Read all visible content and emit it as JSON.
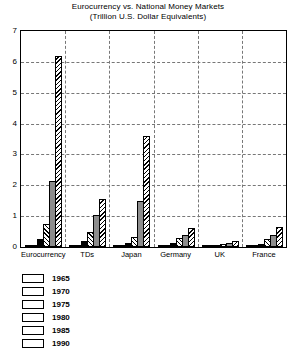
{
  "chart_data": {
    "type": "bar",
    "title": "Eurocurrency vs. National Money Markets",
    "subtitle": "(Trillion U.S.  Dollar Equivalents)",
    "xlabel": "",
    "ylabel": "",
    "ylim": [
      0,
      7
    ],
    "yticks": [
      0,
      1,
      2,
      3,
      4,
      5,
      6,
      7
    ],
    "grid": true,
    "legend_position": "below-left",
    "categories": [
      "Eurocurrency",
      "TDs",
      "Japan",
      "Germany",
      "UK",
      "France"
    ],
    "series": [
      {
        "name": "1965",
        "pattern": "solid-black",
        "color": "#000000",
        "values": [
          0.02,
          0.03,
          0.02,
          0.02,
          0.01,
          0.02
        ]
      },
      {
        "name": "1970",
        "pattern": "white",
        "color": "#ffffff",
        "values": [
          0.05,
          0.07,
          0.04,
          0.04,
          0.02,
          0.04
        ]
      },
      {
        "name": "1975",
        "pattern": "solid-black",
        "color": "#000000",
        "values": [
          0.25,
          0.2,
          0.12,
          0.13,
          0.06,
          0.1
        ]
      },
      {
        "name": "1980",
        "pattern": "hatch-forward",
        "color": "#ffffff",
        "values": [
          0.75,
          0.48,
          0.33,
          0.3,
          0.1,
          0.25
        ]
      },
      {
        "name": "1985",
        "pattern": "gray",
        "color": "#8d8d8d",
        "values": [
          2.15,
          1.05,
          1.5,
          0.4,
          0.14,
          0.4
        ]
      },
      {
        "name": "1990",
        "pattern": "hatch-backward",
        "color": "#ffffff",
        "values": [
          6.2,
          1.55,
          3.6,
          0.62,
          0.2,
          0.65
        ]
      }
    ]
  },
  "legend": {
    "items": [
      {
        "label": "1965"
      },
      {
        "label": "1970"
      },
      {
        "label": "1975"
      },
      {
        "label": "1980"
      },
      {
        "label": "1985"
      },
      {
        "label": "1990"
      }
    ]
  }
}
